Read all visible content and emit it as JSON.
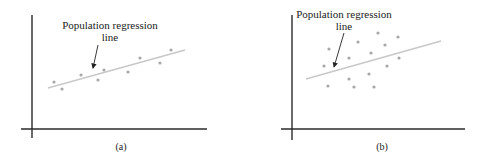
{
  "panels": [
    {
      "id": "a",
      "caption": "(a)",
      "annotation_line1": "Population regression",
      "annotation_line2": "line",
      "points": [
        [
          54,
          82
        ],
        [
          62,
          89
        ],
        [
          81,
          75
        ],
        [
          98,
          80
        ],
        [
          104,
          70
        ],
        [
          128,
          72
        ],
        [
          140,
          58
        ],
        [
          160,
          63
        ],
        [
          171,
          50
        ]
      ],
      "line": [
        48,
        88,
        185,
        50
      ]
    },
    {
      "id": "b",
      "caption": "(b)",
      "annotation_line1": "Population regression",
      "annotation_line2": "line",
      "points": [
        [
          329,
          49
        ],
        [
          324,
          66
        ],
        [
          349,
          58
        ],
        [
          358,
          42
        ],
        [
          378,
          33
        ],
        [
          385,
          45
        ],
        [
          371,
          53
        ],
        [
          398,
          37
        ],
        [
          399,
          58
        ],
        [
          387,
          66
        ],
        [
          349,
          79
        ],
        [
          328,
          86
        ],
        [
          354,
          87
        ],
        [
          374,
          87
        ],
        [
          369,
          74
        ]
      ],
      "line": [
        306,
        79,
        441,
        41
      ]
    }
  ],
  "colors": {
    "axis": "#2a2a2a",
    "regression_line": "#c8c8c8",
    "points": "#a8a8a8"
  }
}
